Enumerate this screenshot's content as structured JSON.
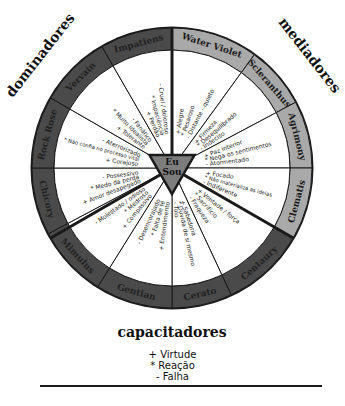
{
  "diagram": {
    "center": {
      "line1": "Eu",
      "line2": "Sou"
    },
    "groups": {
      "top_right": "mediadores",
      "top_left": "dominadores",
      "bottom": "capacitadores"
    },
    "colors": {
      "light_ring": "#a9a9a9",
      "dark_ring": "#4a4a4a",
      "lines": "#1a1a1a",
      "center": "#7d7d7d"
    },
    "segments": [
      {
        "name": "Water Violet",
        "start": 0,
        "end": 36,
        "tone": "light",
        "items": [
          "+ Alegre",
          "* Pesaroso",
          "- Distante - quieto"
        ]
      },
      {
        "name": "Scleranthus",
        "start": 36,
        "end": 62,
        "tone": "light",
        "items": [
          "+ Firmeza",
          "* Desequilibrado",
          "- Indeciso"
        ]
      },
      {
        "name": "Agrimony",
        "start": 62,
        "end": 90,
        "tone": "light",
        "items": [
          "+ Paz interior",
          "* Nega os sentimentos",
          "- Atormentado"
        ]
      },
      {
        "name": "Clematis",
        "start": 90,
        "end": 120,
        "tone": "light",
        "items": [
          "+ Focado",
          "* Não materializa as ideias",
          "- Indiferente"
        ]
      },
      {
        "name": "Centaury",
        "start": 120,
        "end": 155,
        "tone": "dark",
        "items": [
          "+ Vontade / força",
          "* Sacrifício",
          "- Fraqueza"
        ]
      },
      {
        "name": "Cerato",
        "start": 155,
        "end": 180,
        "tone": "dark",
        "items": [
          "+ Sabedoria",
          "* Dúvida de si mesmo",
          "- Tolo"
        ]
      },
      {
        "name": "Gentian",
        "start": 180,
        "end": 212,
        "tone": "dark",
        "items": [
          "+ Entendimento",
          "* Falta de fé",
          "- Desencorajado"
        ]
      },
      {
        "name": "Mimulus",
        "start": 212,
        "end": 242,
        "tone": "dark",
        "items": [
          "+ Compassivo",
          "* Medroso",
          "- Molestado / odioso"
        ]
      },
      {
        "name": "Chicory",
        "start": 242,
        "end": 270,
        "tone": "dark",
        "items": [
          "+ Amor desapegado",
          "* Medo da perda",
          "- Possessivo"
        ]
      },
      {
        "name": "Rock Rose",
        "start": 270,
        "end": 300,
        "tone": "dark",
        "items": [
          "+ Corajoso",
          "* Não confia no processo vital",
          "- Aterrorizado"
        ]
      },
      {
        "name": "Vervain",
        "start": 300,
        "end": 330,
        "tone": "dark",
        "items": [
          "+ Tolerante",
          "* Muito idealista",
          "- Fanático"
        ]
      },
      {
        "name": "Impatiens",
        "start": 330,
        "end": 360,
        "tone": "dark",
        "items": [
          "+ Perdão",
          "* Impaciência",
          "- Cruel / doloroso"
        ]
      }
    ]
  },
  "legend": {
    "virtue": "+ Virtude",
    "reaction": "* Reação",
    "fault": "- Falha"
  }
}
